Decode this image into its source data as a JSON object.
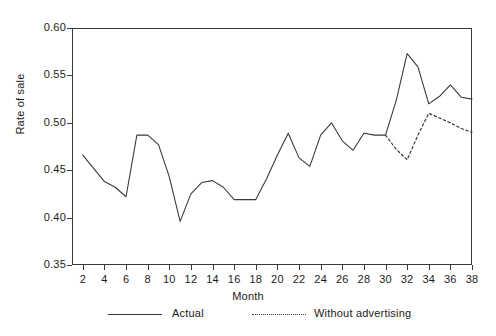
{
  "chart_data": {
    "type": "line",
    "title": "",
    "xlabel": "Month",
    "ylabel": "Rate of sale",
    "xlim": [
      1,
      38
    ],
    "ylim": [
      0.35,
      0.6
    ],
    "grid": false,
    "legend_position": "bottom",
    "x_ticks": [
      2,
      4,
      6,
      8,
      10,
      12,
      14,
      16,
      18,
      20,
      22,
      24,
      26,
      28,
      30,
      32,
      34,
      36,
      38
    ],
    "y_ticks": [
      "0.35",
      "0.40",
      "0.45",
      "0.50",
      "0.55",
      "0.60"
    ],
    "series": [
      {
        "name": "Actual",
        "style": "solid",
        "color": "#3a3a3a",
        "x": [
          2,
          3,
          4,
          5,
          6,
          7,
          8,
          9,
          10,
          11,
          12,
          13,
          14,
          15,
          16,
          17,
          18,
          19,
          20,
          21,
          22,
          23,
          24,
          25,
          26,
          27,
          28,
          29,
          30,
          31,
          32,
          33,
          34,
          35,
          36,
          37,
          38
        ],
        "values": [
          0.466,
          0.452,
          0.438,
          0.432,
          0.422,
          0.487,
          0.487,
          0.477,
          0.443,
          0.396,
          0.425,
          0.437,
          0.439,
          0.432,
          0.419,
          0.419,
          0.419,
          0.441,
          0.466,
          0.489,
          0.463,
          0.454,
          0.487,
          0.5,
          0.481,
          0.471,
          0.489,
          0.487,
          0.487,
          0.524,
          0.573,
          0.559,
          0.52,
          0.528,
          0.54,
          0.527,
          0.525
        ]
      },
      {
        "name": "Without advertising",
        "style": "dotted",
        "color": "#3a3a3a",
        "x": [
          30,
          31,
          32,
          33,
          34,
          35,
          36,
          37,
          38
        ],
        "values": [
          0.487,
          0.472,
          0.461,
          0.487,
          0.51,
          0.505,
          0.5,
          0.494,
          0.49
        ]
      }
    ]
  },
  "axes": {
    "y_label": "Rate of sale",
    "x_label": "Month"
  },
  "legend": {
    "items": [
      {
        "label": "Actual",
        "style": "solid"
      },
      {
        "label": "Without advertising",
        "style": "dotted"
      }
    ]
  }
}
